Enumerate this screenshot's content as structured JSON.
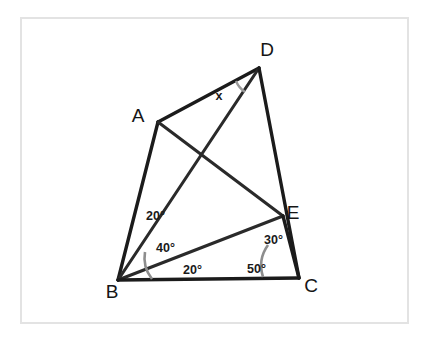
{
  "figure": {
    "kind": "geometry-diagram",
    "background_color": "#ffffff",
    "frame_color": "#e3e3e3",
    "line_color": "#1b1b1b",
    "arc_color": "#8d8d8d",
    "label_color": "#151515"
  },
  "vertices": [
    {
      "id": "A",
      "label": "A",
      "x": 158,
      "y": 122,
      "label_x": 138,
      "label_y": 122
    },
    {
      "id": "B",
      "label": "B",
      "x": 118,
      "y": 280,
      "label_x": 112,
      "label_y": 298
    },
    {
      "id": "C",
      "label": "C",
      "x": 299,
      "y": 278,
      "label_x": 311,
      "label_y": 292
    },
    {
      "id": "D",
      "label": "D",
      "x": 259,
      "y": 68,
      "label_x": 267,
      "label_y": 56
    },
    {
      "id": "E",
      "label": "E",
      "x": 283,
      "y": 216,
      "label_x": 293,
      "label_y": 219
    }
  ],
  "segments": [
    {
      "id": "AB",
      "from": "A",
      "to": "B"
    },
    {
      "id": "AD",
      "from": "A",
      "to": "D"
    },
    {
      "id": "AE",
      "from": "A",
      "to": "E"
    },
    {
      "id": "BD",
      "from": "B",
      "to": "D"
    },
    {
      "id": "BE",
      "from": "B",
      "to": "E"
    },
    {
      "id": "BC",
      "from": "B",
      "to": "C"
    },
    {
      "id": "DC",
      "from": "D",
      "to": "C"
    },
    {
      "id": "EC",
      "from": "E",
      "to": "C"
    }
  ],
  "angle_labels": [
    {
      "id": "angle-abd",
      "text": "20°",
      "x": 146,
      "y": 220,
      "at_vertex": "B",
      "between": "BA-BD"
    },
    {
      "id": "angle-dbe",
      "text": "40°",
      "x": 156,
      "y": 252,
      "at_vertex": "B",
      "between": "BD-BE"
    },
    {
      "id": "angle-ebc",
      "text": "20°",
      "x": 183,
      "y": 274,
      "at_vertex": "B",
      "between": "BE-BC"
    },
    {
      "id": "angle-ecd",
      "text": "30°",
      "x": 264,
      "y": 244,
      "at_vertex": "C",
      "between": "CE-CD"
    },
    {
      "id": "angle-bce",
      "text": "50°",
      "x": 247,
      "y": 273,
      "at_vertex": "C",
      "between": "CB-CE"
    },
    {
      "id": "angle-x",
      "text": "x",
      "x": 219,
      "y": 100,
      "at_vertex": "D",
      "between": "DA-DB"
    }
  ],
  "unknown": {
    "symbol": "x",
    "at_vertex": "D",
    "meaning": "angle ADB"
  }
}
